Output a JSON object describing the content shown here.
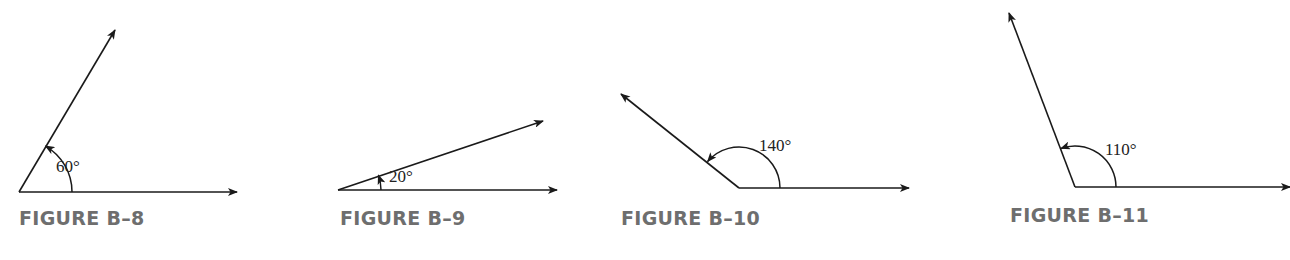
{
  "figures": [
    {
      "caption": "FIGURE B–8",
      "angle_label": "60°",
      "angle_deg": 60,
      "vertex": [
        19,
        192
      ],
      "ray_end_1": [
        237,
        192
      ],
      "ray_end_2": [
        115,
        30
      ],
      "arc_radius": 53,
      "label_pos": [
        56,
        172
      ],
      "caption_pos": [
        19,
        207
      ]
    },
    {
      "caption": "FIGURE B–9",
      "angle_label": "20°",
      "angle_deg": 20,
      "vertex": [
        338,
        190
      ],
      "ray_end_1": [
        557,
        190
      ],
      "ray_end_2": [
        543,
        121
      ],
      "arc_radius": 43,
      "label_pos": [
        389,
        182
      ],
      "caption_pos": [
        340,
        207
      ]
    },
    {
      "caption": "FIGURE B–10",
      "angle_label": "140°",
      "angle_deg": 140,
      "vertex": [
        739,
        188
      ],
      "ray_end_1": [
        909,
        188
      ],
      "ray_end_2": [
        621,
        94
      ],
      "arc_radius": 41,
      "label_pos": [
        759,
        151
      ],
      "caption_pos": [
        621,
        207
      ]
    },
    {
      "caption": "FIGURE B–11",
      "angle_label": "110°",
      "angle_deg": 110,
      "vertex": [
        1075,
        187
      ],
      "ray_end_1": [
        1290,
        187
      ],
      "ray_end_2": [
        1009,
        13
      ],
      "arc_radius": 41,
      "label_pos": [
        1105,
        155
      ],
      "caption_pos": [
        1010,
        204
      ]
    }
  ],
  "colors": {
    "line": "#1a1a1a",
    "caption": "#6e6e6e"
  }
}
